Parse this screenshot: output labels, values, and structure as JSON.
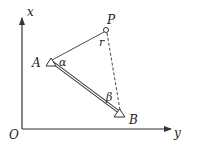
{
  "diagram": {
    "colors": {
      "stroke": "#333333",
      "text": "#222222",
      "background": "#ffffff"
    },
    "axes": {
      "origin_label": "O",
      "vertical_label": "x",
      "horizontal_label": "y"
    },
    "points": {
      "A": {
        "label": "A",
        "angle_label": "α",
        "marker": "triangle"
      },
      "B": {
        "label": "B",
        "angle_label": "β",
        "marker": "triangle"
      },
      "P": {
        "label": "P",
        "distance_label": "r",
        "marker": "circle"
      }
    },
    "segments": [
      {
        "from": "A",
        "to": "P",
        "style": "solid-thin"
      },
      {
        "from": "A",
        "to": "B",
        "style": "double-line"
      },
      {
        "from": "P",
        "to": "B",
        "style": "dashed"
      }
    ]
  }
}
